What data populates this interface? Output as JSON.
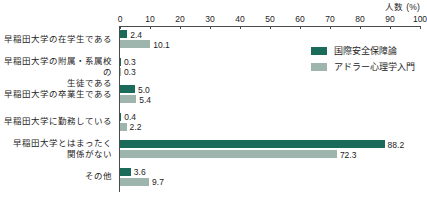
{
  "chart_data": {
    "type": "bar",
    "orientation": "horizontal",
    "title": "",
    "xlabel": "人数 (%)",
    "ylabel": "",
    "xlim": [
      0,
      100
    ],
    "xticks": [
      0,
      10,
      20,
      30,
      40,
      50,
      60,
      70,
      80,
      90,
      100
    ],
    "grid": false,
    "legend_position": "top-right",
    "categories": [
      "早稲田大学の在学生である",
      "早稲田大学の附属・系属校の生徒である",
      "早稲田大学の卒業生である",
      "早稲田大学に勤務している",
      "早稲田大学とはまったく関係がない",
      "その他"
    ],
    "category_lines": [
      [
        "早稲田大学の在学生である"
      ],
      [
        "早稲田大学の附属・系属校の",
        "生徒である"
      ],
      [
        "早稲田大学の卒業生である"
      ],
      [
        "早稲田大学に勤務している"
      ],
      [
        "早稲田大学とはまったく",
        "関係がない"
      ],
      [
        "その他"
      ]
    ],
    "series": [
      {
        "name": "国際安全保障論",
        "color": "#1a6b5a",
        "values": [
          2.4,
          0.3,
          5.0,
          0.4,
          88.2,
          3.6
        ],
        "labels": [
          "2.4",
          "0.3",
          "5.0",
          "0.4",
          "88.2",
          "3.6"
        ]
      },
      {
        "name": "アドラー心理学入門",
        "color": "#9eb5ae",
        "values": [
          10.1,
          0.3,
          5.4,
          2.2,
          72.3,
          9.7
        ],
        "labels": [
          "10.1",
          "0.3",
          "5.4",
          "2.2",
          "72.3",
          "9.7"
        ]
      }
    ]
  },
  "axis": {
    "title": "人数 (%)",
    "tick_labels": [
      "0",
      "10",
      "20",
      "30",
      "40",
      "50",
      "60",
      "70",
      "80",
      "90",
      "100"
    ]
  },
  "legend": {
    "items": [
      {
        "label": "国際安全保障論",
        "color": "#1a6b5a"
      },
      {
        "label": "アドラー心理学入門",
        "color": "#9eb5ae"
      }
    ]
  },
  "caption": {
    "text": ""
  }
}
